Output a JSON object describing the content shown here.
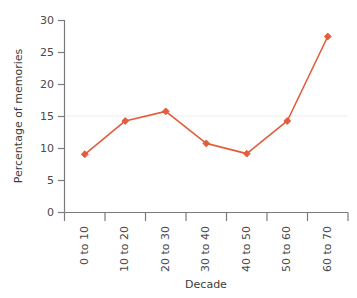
{
  "chart_data": {
    "type": "line",
    "title": "",
    "xlabel": "Decade",
    "ylabel": "Percentage of memories",
    "categories": [
      "0 to 10",
      "10 to 20",
      "20 to 30",
      "30 to 40",
      "40 to 50",
      "50 to 60",
      "60 to 70"
    ],
    "values": [
      9.1,
      14.3,
      15.8,
      10.8,
      9.2,
      14.3,
      27.5
    ],
    "series": [
      {
        "name": "Percentage of memories",
        "values": [
          9.1,
          14.3,
          15.8,
          10.8,
          9.2,
          14.3,
          27.5
        ]
      }
    ],
    "ylim": [
      0,
      30
    ],
    "yticks": [
      0,
      5,
      10,
      15,
      20,
      25,
      30
    ],
    "ytick_labels": [
      "0",
      "5",
      "10",
      "15",
      "20",
      "25",
      "30"
    ],
    "grid": "faint-horizontal",
    "legend": "none",
    "marker": "diamond",
    "colors": {
      "line": "#E35C3C",
      "marker": "#E35C3C",
      "axis": "#7a7a7a",
      "grid": "#f2e9e8",
      "text": "#3c3c3c",
      "background": "#ffffff"
    },
    "xtick_label_rotation": -90
  },
  "axes": {
    "y_title": "Percentage of memories",
    "x_title": "Decade"
  }
}
